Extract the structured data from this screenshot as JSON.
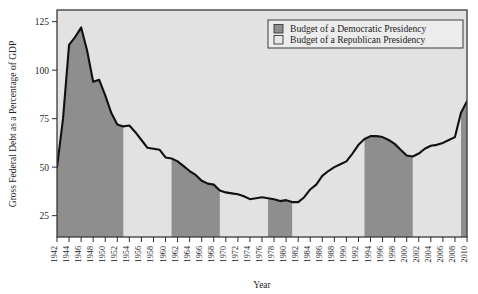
{
  "figure": {
    "name": "gross-federal-debt-chart",
    "plot_bg": "#e2e2e2",
    "frame_color": "#3a3a3a",
    "line_color": "#111111",
    "democrat_fill": "#8e8e8e",
    "republican_fill": "#e2e2e2"
  },
  "axes": {
    "y_label": "Gross Federal Debt as a Percentage of GDP",
    "x_label": "Year",
    "y_ticks": [
      "25",
      "50",
      "75",
      "100",
      "125"
    ],
    "x_ticks": [
      "1942",
      "1944",
      "1946",
      "1948",
      "1950",
      "1952",
      "1954",
      "1956",
      "1958",
      "1960",
      "1962",
      "1964",
      "1966",
      "1968",
      "1970",
      "1972",
      "1974",
      "1976",
      "1978",
      "1980",
      "1982",
      "1984",
      "1986",
      "1988",
      "1990",
      "1992",
      "1994",
      "1996",
      "1998",
      "2000",
      "2002",
      "2004",
      "2006",
      "2008",
      "2010"
    ]
  },
  "legend": {
    "items": [
      {
        "label": "Budget of a Democratic Presidency",
        "swatch": "#8e8e8e",
        "swatch_name": "democratic-swatch"
      },
      {
        "label": "Budget of a Republican Presidency",
        "swatch": "#e8e8e8",
        "swatch_name": "republican-swatch"
      }
    ]
  },
  "chart_data": {
    "type": "area",
    "title": "",
    "xlabel": "Year",
    "ylabel": "Gross Federal Debt as a Percentage of GDP",
    "xlim": [
      1942,
      2010
    ],
    "ylim": [
      14,
      131
    ],
    "grid": false,
    "legend_position": "top-right",
    "x": [
      1942,
      1943,
      1944,
      1945,
      1946,
      1947,
      1948,
      1949,
      1950,
      1951,
      1952,
      1953,
      1954,
      1955,
      1956,
      1957,
      1958,
      1959,
      1960,
      1961,
      1962,
      1963,
      1964,
      1965,
      1966,
      1967,
      1968,
      1969,
      1970,
      1971,
      1972,
      1973,
      1974,
      1975,
      1976,
      1977,
      1978,
      1979,
      1980,
      1981,
      1982,
      1983,
      1984,
      1985,
      1986,
      1987,
      1988,
      1989,
      1990,
      1991,
      1992,
      1993,
      1994,
      1995,
      1996,
      1997,
      1998,
      1999,
      2000,
      2001,
      2002,
      2003,
      2004,
      2005,
      2006,
      2007,
      2008,
      2009,
      2010
    ],
    "values": [
      50.0,
      75.0,
      113.0,
      117.0,
      122.0,
      110.0,
      94.0,
      95.0,
      87.0,
      78.0,
      72.0,
      71.0,
      71.5,
      68.0,
      64.0,
      60.0,
      59.5,
      59.0,
      55.0,
      54.5,
      53.0,
      50.5,
      48.0,
      46.0,
      43.0,
      41.5,
      41.0,
      38.0,
      37.0,
      36.5,
      36.0,
      35.0,
      33.5,
      34.0,
      34.5,
      34.0,
      33.5,
      32.5,
      33.0,
      32.0,
      32.0,
      34.5,
      38.5,
      41.0,
      45.5,
      48.0,
      50.0,
      51.5,
      53.0,
      57.0,
      61.5,
      64.5,
      66.0,
      66.0,
      65.5,
      64.0,
      62.0,
      59.0,
      56.0,
      55.5,
      57.0,
      59.5,
      61.0,
      61.5,
      62.5,
      64.0,
      65.5,
      78.0,
      84.0
    ],
    "series_segments": [
      {
        "party": "Democratic",
        "start": 1942,
        "end": 1953,
        "label": "Roosevelt / Truman"
      },
      {
        "party": "Republican",
        "start": 1953,
        "end": 1961,
        "label": "Eisenhower"
      },
      {
        "party": "Democratic",
        "start": 1961,
        "end": 1969,
        "label": "Kennedy / Johnson"
      },
      {
        "party": "Republican",
        "start": 1969,
        "end": 1977,
        "label": "Nixon / Ford"
      },
      {
        "party": "Democratic",
        "start": 1977,
        "end": 1981,
        "label": "Carter"
      },
      {
        "party": "Republican",
        "start": 1981,
        "end": 1993,
        "label": "Reagan / Bush"
      },
      {
        "party": "Democratic",
        "start": 1993,
        "end": 2001,
        "label": "Clinton"
      },
      {
        "party": "Republican",
        "start": 2001,
        "end": 2009,
        "label": "Bush"
      },
      {
        "party": "Democratic",
        "start": 2009,
        "end": 2010,
        "label": "Obama"
      }
    ]
  }
}
